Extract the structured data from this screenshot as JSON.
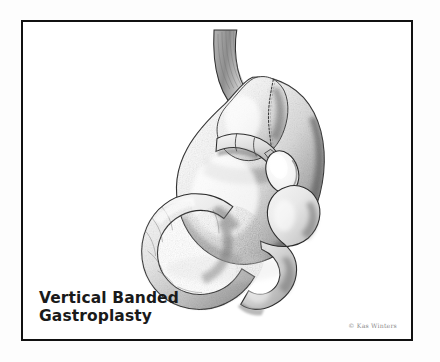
{
  "plate": {
    "caption": {
      "line1": "Vertical Banded",
      "line2": "Gastroplasty"
    },
    "credit": "© Kas Winters",
    "frame_color": "#111111",
    "paper_color": "#ffffff",
    "ink_color": "#1a1a1a"
  },
  "illustration": {
    "subject": "vertical banded gastroplasty anatomical drawing",
    "medium": "graphite pencil stipple rendering",
    "parts": [
      {
        "name": "esophagus",
        "label": "esophagus"
      },
      {
        "name": "gastric-pouch",
        "label": "upper gastric pouch"
      },
      {
        "name": "staple-line",
        "label": "vertical staple line"
      },
      {
        "name": "restrictive-band",
        "label": "restrictive band"
      },
      {
        "name": "stoma",
        "label": "stoma outlet"
      },
      {
        "name": "stomach-body",
        "label": "stomach body"
      },
      {
        "name": "greater-curvature",
        "label": "greater curvature"
      },
      {
        "name": "antrum",
        "label": "antrum"
      },
      {
        "name": "pylorus",
        "label": "pylorus"
      },
      {
        "name": "duodenum",
        "label": "duodenum"
      },
      {
        "name": "jejunum-loop",
        "label": "jejunal loop"
      }
    ],
    "band_segments": 3
  }
}
